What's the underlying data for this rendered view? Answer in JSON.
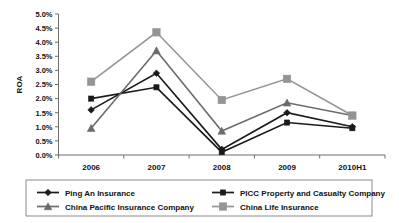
{
  "chart_data": {
    "type": "line",
    "title": "",
    "xlabel": "",
    "ylabel": "ROA",
    "categories": [
      "2006",
      "2007",
      "2008",
      "2009",
      "2010H1"
    ],
    "ytick_labels": [
      "0.0%",
      "0.5%",
      "1.0%",
      "1.5%",
      "2.0%",
      "2.5%",
      "3.0%",
      "3.5%",
      "4.0%",
      "4.5%",
      "5.0%"
    ],
    "ylim": [
      0.0,
      5.0
    ],
    "ytick_step": 0.5,
    "yunit": "%",
    "grid": false,
    "legend_position": "bottom",
    "series": [
      {
        "name": "Ping An Insurance",
        "marker": "diamond",
        "color": "#1a1a1a",
        "values": [
          1.6,
          2.9,
          0.2,
          1.5,
          1.0
        ]
      },
      {
        "name": "PICC Property and Casualty Company",
        "marker": "square-small",
        "color": "#1a1a1a",
        "values": [
          2.0,
          2.4,
          0.1,
          1.15,
          0.95
        ]
      },
      {
        "name": "China Pacific Insurance Company",
        "marker": "triangle",
        "color": "#6b6b6b",
        "values": [
          0.95,
          3.7,
          0.85,
          1.85,
          1.4
        ]
      },
      {
        "name": "China Life Insurance",
        "marker": "square-large",
        "color": "#949494",
        "values": [
          2.6,
          4.35,
          1.95,
          2.7,
          1.4
        ]
      }
    ]
  },
  "legend": {
    "entries": [
      "Ping An Insurance",
      "PICC Property and Casualty Company",
      "China Pacific Insurance Company",
      "China Life Insurance"
    ]
  }
}
